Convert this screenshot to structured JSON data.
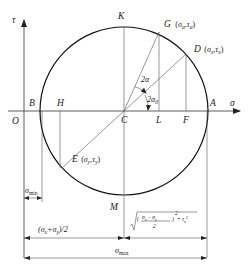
{
  "diagram": {
    "axes": {
      "tau_label": "τ",
      "sigma_label": "σ",
      "origin_label": "O"
    },
    "points": {
      "center": "C",
      "top": "K",
      "bottom": "M",
      "left_intersect": "B",
      "right_intersect": "A",
      "G": "G",
      "G_coords": "(σα , τα)",
      "D": "D",
      "D_coords": "(σx , τx)",
      "E": "E",
      "E_coords": "(σy , τy)",
      "H": "H",
      "L": "L",
      "F": "F"
    },
    "angles": {
      "two_alpha": "2α",
      "two_alpha0": "2α0"
    },
    "dimensions": {
      "sigma_min": "σmin",
      "mean_stress": "(σx+σy)/2",
      "radius_formula": "√((σx − σy)/2)² + τx²",
      "sigma_max": "σmax"
    }
  }
}
